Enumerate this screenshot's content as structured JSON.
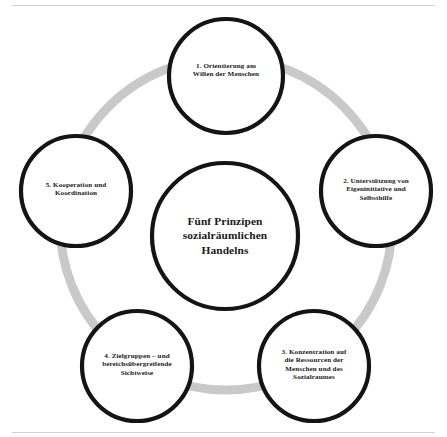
{
  "diagram": {
    "type": "cycle-diagram",
    "center": {
      "label": "Fünf Prinzipen sozialräumlichen Handelns",
      "line1": "Fünf Prinzipen",
      "line2": "sozialräumlichen",
      "line3": "Handelns"
    },
    "colors": {
      "circle_stroke": "#141414",
      "ring": "#c9c9c9",
      "background": "#ffffff",
      "text": "#1a1a1a",
      "rule": "#d0d0d0"
    },
    "nodes": [
      {
        "number": "1.",
        "label": "1. Orientierung am Willen der Menschen",
        "line1": "1. Orientierung am",
        "line2": "Willen der Menschen",
        "line3": "",
        "line4": "",
        "cx": 226,
        "cy": 76,
        "r": 57
      },
      {
        "number": "2.",
        "label": "2. Unterstützung von Eigeninitiative und Selbsthilfe",
        "line1": "2. Unterstützung von",
        "line2": "Eigeninitiative und",
        "line3": "Selbsthilfe",
        "line4": "",
        "cx": 376,
        "cy": 191,
        "r": 55
      },
      {
        "number": "3.",
        "label": "3. Konzentration auf die Ressourcen der Menschen und des Sozialraumes",
        "line1": "3. Konzentration auf",
        "line2": "die Ressourcen der",
        "line3": "Menschen und des",
        "line4": "Sozialraumes",
        "cx": 314,
        "cy": 366,
        "r": 55
      },
      {
        "number": "4.",
        "label": "4. Zielgruppen – und bereichsübergreifende Sichtweise",
        "line1": "4. Zielgruppen – und",
        "line2": "bereichsübergreifende",
        "line3": "Sichtweise",
        "line4": "",
        "cx": 137,
        "cy": 366,
        "r": 55
      },
      {
        "number": "5.",
        "label": "5. Kooperation und Koordination",
        "line1": "5. Kooperation und",
        "line2": "Koordination",
        "line3": "",
        "line4": "",
        "cx": 76,
        "cy": 191,
        "r": 55
      }
    ]
  }
}
